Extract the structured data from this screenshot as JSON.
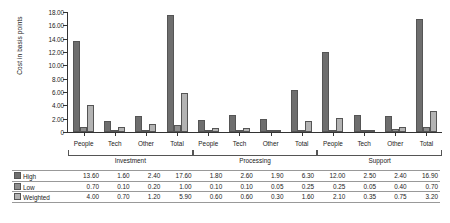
{
  "chart_data": {
    "type": "bar",
    "title": "",
    "xlabel": "",
    "ylabel": "Cost in basis points",
    "ylim": [
      0,
      18
    ],
    "ytick_step": 2,
    "ytick_labels": [
      "18.00",
      "16.00",
      "14.00",
      "12.00",
      "10.00",
      "8.00",
      "6.00",
      "4.00",
      "2.00",
      "0"
    ],
    "grid": false,
    "legend_position": "table-row-headers",
    "groups": [
      {
        "name": "Investment",
        "categories": [
          "People",
          "Tech",
          "Other",
          "Total"
        ]
      },
      {
        "name": "Processing",
        "categories": [
          "People",
          "Tech",
          "Other",
          "Total"
        ]
      },
      {
        "name": "Support",
        "categories": [
          "People",
          "Tech",
          "Other",
          "Total"
        ]
      }
    ],
    "categories": [
      "People",
      "Tech",
      "Other",
      "Total",
      "People",
      "Tech",
      "Other",
      "Total",
      "People",
      "Tech",
      "Other",
      "Total"
    ],
    "series": [
      {
        "name": "High",
        "color": "#6e6e6e",
        "values": [
          13.6,
          1.6,
          2.4,
          17.6,
          1.8,
          2.6,
          1.9,
          6.3,
          12.0,
          2.5,
          2.4,
          16.9
        ]
      },
      {
        "name": "Low",
        "color": "#8e8e8e",
        "values": [
          0.7,
          0.1,
          0.2,
          1.0,
          0.1,
          0.1,
          0.05,
          0.25,
          0.25,
          0.05,
          0.4,
          0.7
        ]
      },
      {
        "name": "Weighted",
        "color": "#b3b3b3",
        "values": [
          4.0,
          0.7,
          1.2,
          5.9,
          0.6,
          0.6,
          0.3,
          1.6,
          2.1,
          0.35,
          0.75,
          3.2
        ]
      }
    ]
  },
  "table": {
    "rows": [
      {
        "label": "High",
        "values": [
          "13.60",
          "1.60",
          "2.40",
          "17.60",
          "1.80",
          "2.60",
          "1.90",
          "6.30",
          "12.00",
          "2.50",
          "2.40",
          "16.90"
        ]
      },
      {
        "label": "Low",
        "values": [
          "0.70",
          "0.10",
          "0.20",
          "1.00",
          "0.10",
          "0.10",
          "0.05",
          "0.25",
          "0.25",
          "0.05",
          "0.40",
          "0.70"
        ]
      },
      {
        "label": "Weighted",
        "values": [
          "4.00",
          "0.70",
          "1.20",
          "5.90",
          "0.60",
          "0.60",
          "0.30",
          "1.60",
          "2.10",
          "0.35",
          "0.75",
          "3.20"
        ]
      }
    ]
  }
}
